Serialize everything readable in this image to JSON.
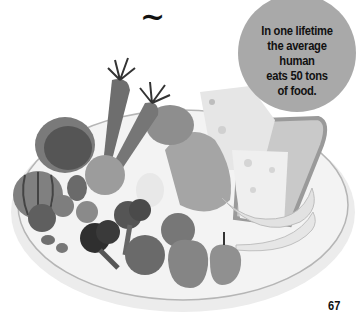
{
  "header": {
    "ornament": "~"
  },
  "callout": {
    "lines": [
      "In one lifetime",
      "the average human",
      "eats 50 tons",
      "of food."
    ],
    "background": "#a9a9a9"
  },
  "illustration": {
    "subject": "plate-of-food",
    "items": [
      "cabbage",
      "carrot",
      "carrot",
      "pumpkin",
      "tomato",
      "strawberry",
      "broccoli",
      "broccoli",
      "apple",
      "apple",
      "pear",
      "banana",
      "bread-slice",
      "cheese",
      "chicken-leg",
      "egg",
      "nuts",
      "orange"
    ]
  },
  "footer": {
    "page_number": "67"
  }
}
